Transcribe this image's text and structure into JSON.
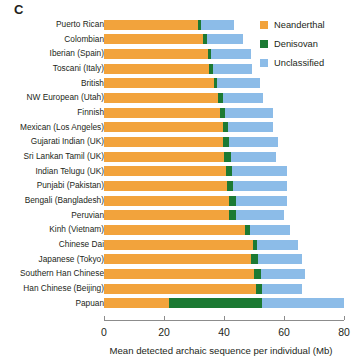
{
  "panel": {
    "label": "C"
  },
  "legend": {
    "items": [
      {
        "label": "Neanderthal",
        "color": "#F2A33C"
      },
      {
        "label": "Denisovan",
        "color": "#1C7A33"
      },
      {
        "label": "Unclassified",
        "color": "#8CBCE8"
      }
    ]
  },
  "axis": {
    "xlabel": "Mean detected archaic sequence per individual (Mb)",
    "ticks": [
      "0",
      "20",
      "40",
      "60",
      "80"
    ],
    "xmin": 0,
    "xmax": 80
  },
  "chart_data": {
    "type": "bar",
    "orientation": "horizontal",
    "stacked": true,
    "title": "",
    "xlabel": "Mean detected archaic sequence per individual (Mb)",
    "ylabel": "",
    "xlim": [
      0,
      80
    ],
    "xticks": [
      0,
      20,
      40,
      60,
      80
    ],
    "grid": false,
    "legend_position": "top-right",
    "categories": [
      "Puerto Rican",
      "Colombian",
      "Iberian (Spain)",
      "Toscani (Italy)",
      "British",
      "NW European (Utah)",
      "Finnish",
      "Mexican (Los Angeles)",
      "Gujarati Indian (UK)",
      "Sri Lankan Tamil (UK)",
      "Indian Telugu (UK)",
      "Punjabi (Pakistan)",
      "Bengali (Bangladesh)",
      "Peruvian",
      "Kinh (Vietnam)",
      "Chinese Dai",
      "Japanese (Tokyo)",
      "Southern Han Chinese",
      "Han Chinese (Beijing)",
      "Papuan"
    ],
    "series": [
      {
        "name": "Neanderthal",
        "color": "#F2A33C",
        "values": [
          31.3,
          33.0,
          34.5,
          35.0,
          36.5,
          38.0,
          38.5,
          39.5,
          39.5,
          40.0,
          40.5,
          41.0,
          41.5,
          41.5,
          47.0,
          49.5,
          49.0,
          50.0,
          50.5,
          21.5
        ]
      },
      {
        "name": "Denisovan",
        "color": "#1C7A33",
        "values": [
          1.0,
          1.2,
          1.3,
          1.2,
          1.3,
          1.5,
          1.7,
          1.8,
          2.2,
          2.2,
          2.0,
          2.0,
          2.5,
          2.5,
          1.5,
          1.5,
          2.3,
          2.3,
          2.3,
          31.0
        ]
      },
      {
        "name": "Unclassified",
        "color": "#8CBCE8",
        "values": [
          11.2,
          12.3,
          13.2,
          13.3,
          14.2,
          13.5,
          16.3,
          15.2,
          16.3,
          15.3,
          18.5,
          18.0,
          17.0,
          16.0,
          13.5,
          13.5,
          14.7,
          14.7,
          13.2,
          27.5
        ]
      }
    ],
    "totals": [
      43.5,
      46.5,
      49.0,
      49.5,
      52.0,
      53.0,
      56.5,
      56.5,
      58.0,
      57.5,
      61.0,
      61.0,
      61.0,
      60.0,
      62.0,
      64.5,
      66.0,
      67.0,
      66.0,
      80.0
    ]
  }
}
